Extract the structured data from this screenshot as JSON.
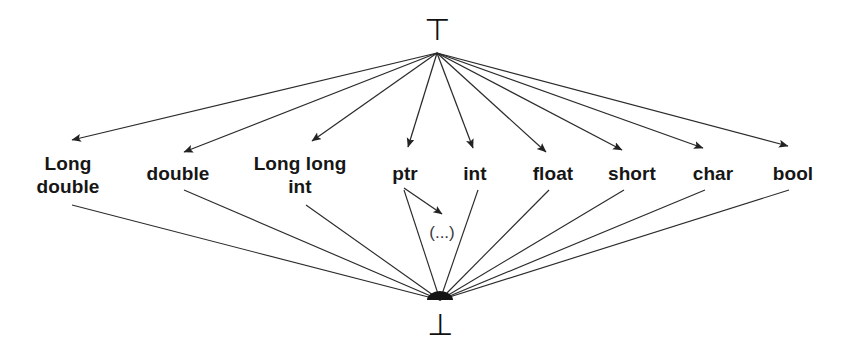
{
  "diagram": {
    "type": "lattice-hasse-diagram",
    "line_color": "#2b2b2b",
    "text_color": "#161616",
    "background": "#ffffff",
    "top_element": {
      "id": "top",
      "label": "⊤",
      "name": "top",
      "x": 437,
      "y": 30
    },
    "bottom_element": {
      "id": "bottom",
      "label": "⊥",
      "name": "bottom",
      "x": 440,
      "y": 325
    },
    "hub_top": {
      "x": 437,
      "y": 53
    },
    "hub_bottom": {
      "x": 440,
      "y": 300
    },
    "types": [
      {
        "id": "long-double",
        "label": "Long\ndouble",
        "x": 68,
        "y": 175,
        "arrow_x": 72,
        "arrow_y": 140,
        "down_x": 72,
        "down_y": 205
      },
      {
        "id": "double",
        "label": "double",
        "x": 178,
        "y": 173,
        "arrow_x": 184,
        "arrow_y": 152,
        "down_x": 184,
        "down_y": 190
      },
      {
        "id": "long-long-int",
        "label": "Long long\nint",
        "x": 300,
        "y": 175,
        "arrow_x": 312,
        "arrow_y": 141,
        "down_x": 306,
        "down_y": 205
      },
      {
        "id": "ptr",
        "label": "ptr",
        "x": 405,
        "y": 173,
        "arrow_x": 408,
        "arrow_y": 147,
        "down_x": 404,
        "down_y": 190
      },
      {
        "id": "int",
        "label": "int",
        "x": 475,
        "y": 173,
        "arrow_x": 473,
        "arrow_y": 148,
        "down_x": 478,
        "down_y": 190
      },
      {
        "id": "float",
        "label": "float",
        "x": 553,
        "y": 173,
        "arrow_x": 546,
        "arrow_y": 152,
        "down_x": 549,
        "down_y": 190
      },
      {
        "id": "short",
        "label": "short",
        "x": 632,
        "y": 173,
        "arrow_x": 622,
        "arrow_y": 150,
        "down_x": 624,
        "down_y": 190
      },
      {
        "id": "char",
        "label": "char",
        "x": 713,
        "y": 173,
        "arrow_x": 703,
        "arrow_y": 148,
        "down_x": 705,
        "down_y": 190
      },
      {
        "id": "bool",
        "label": "bool",
        "x": 793,
        "y": 173,
        "arrow_x": 788,
        "arrow_y": 146,
        "down_x": 789,
        "down_y": 190
      }
    ],
    "ellipsis_node": {
      "id": "ptr-target",
      "label": "(...)",
      "x": 442,
      "y": 232,
      "arrow_from_x": 404,
      "arrow_from_y": 188,
      "arrow_to_x": 442,
      "arrow_to_y": 214
    },
    "edges_note": "All nine type nodes receive an arrow from ⊤ and send a line down to ⊥; ptr also points to an unnamed (...) node."
  }
}
